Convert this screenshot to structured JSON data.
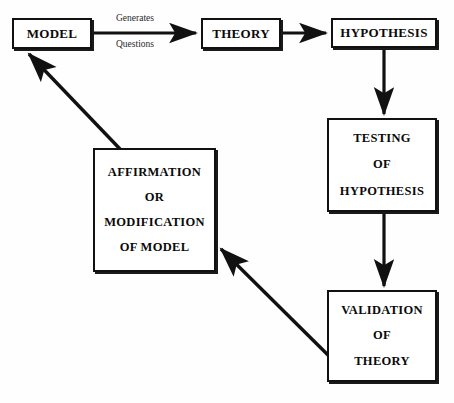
{
  "diagram": {
    "background_color": "#fefefe",
    "stroke_color": "#111111",
    "nodes": [
      {
        "id": "model",
        "lines": [
          "MODEL"
        ]
      },
      {
        "id": "theory",
        "lines": [
          "THEORY"
        ]
      },
      {
        "id": "hypothesis",
        "lines": [
          "HYPOTHESIS"
        ]
      },
      {
        "id": "testing",
        "lines": [
          "TESTING",
          "OF",
          "HYPOTHESIS"
        ]
      },
      {
        "id": "validation",
        "lines": [
          "VALIDATION",
          "OF",
          "THEORY"
        ]
      },
      {
        "id": "affirmation",
        "lines": [
          "AFFIRMATION",
          "OR",
          "MODIFICATION",
          "OF MODEL"
        ]
      }
    ],
    "edge_labels": {
      "generates": "Generates",
      "questions": "Questions"
    },
    "edges": [
      {
        "from": "model",
        "to": "theory",
        "label": "Generates Questions",
        "direction": "right"
      },
      {
        "from": "theory",
        "to": "hypothesis",
        "label": "",
        "direction": "right"
      },
      {
        "from": "hypothesis",
        "to": "testing",
        "label": "",
        "direction": "down"
      },
      {
        "from": "testing",
        "to": "validation",
        "label": "",
        "direction": "down"
      },
      {
        "from": "validation",
        "to": "affirmation",
        "label": "",
        "direction": "up-left"
      },
      {
        "from": "affirmation",
        "to": "model",
        "label": "",
        "direction": "up-left"
      }
    ]
  }
}
